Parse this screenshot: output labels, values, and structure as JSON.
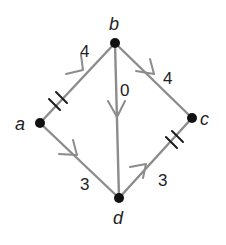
{
  "diagram": {
    "title": "",
    "colors": {
      "edge": "#8c8c8c",
      "node": "#111111",
      "text": "#222222",
      "tick": "#1a1a1a"
    },
    "nodes": [
      {
        "id": "a",
        "label": "a",
        "x": 40,
        "y": 123
      },
      {
        "id": "b",
        "label": "b",
        "x": 115,
        "y": 43
      },
      {
        "id": "c",
        "label": "c",
        "x": 192,
        "y": 118
      },
      {
        "id": "d",
        "label": "d",
        "x": 119,
        "y": 198
      }
    ],
    "edges": [
      {
        "from": "a",
        "to": "b",
        "weight": "4",
        "directed": true,
        "congruence_ticks": 2
      },
      {
        "from": "b",
        "to": "c",
        "weight": "4",
        "directed": true,
        "congruence_ticks": 0
      },
      {
        "from": "b",
        "to": "d",
        "weight": "0",
        "directed": true,
        "congruence_ticks": 0
      },
      {
        "from": "a",
        "to": "d",
        "weight": "3",
        "directed": true,
        "congruence_ticks": 0
      },
      {
        "from": "d",
        "to": "c",
        "weight": "3",
        "directed": true,
        "congruence_ticks": 2
      }
    ],
    "labels": {
      "a": "a",
      "b": "b",
      "c": "c",
      "d": "d",
      "w_ab": "4",
      "w_bc": "4",
      "w_bd": "0",
      "w_ad": "3",
      "w_dc": "3"
    }
  }
}
